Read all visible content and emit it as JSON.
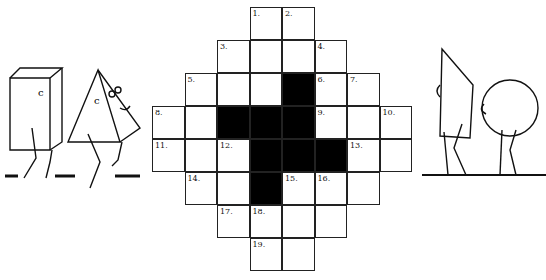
{
  "puzzle": {
    "type": "crossword",
    "cols": 8,
    "rows": 8,
    "cells": [
      {
        "r": 0,
        "c": 3,
        "n": "1."
      },
      {
        "r": 0,
        "c": 4,
        "n": "2."
      },
      {
        "r": 1,
        "c": 2,
        "n": "3."
      },
      {
        "r": 1,
        "c": 3
      },
      {
        "r": 1,
        "c": 4
      },
      {
        "r": 1,
        "c": 5,
        "n": "4."
      },
      {
        "r": 2,
        "c": 1,
        "n": "5."
      },
      {
        "r": 2,
        "c": 2
      },
      {
        "r": 2,
        "c": 3
      },
      {
        "r": 2,
        "c": 4,
        "black": true
      },
      {
        "r": 2,
        "c": 5,
        "n": "6."
      },
      {
        "r": 2,
        "c": 6,
        "n": "7."
      },
      {
        "r": 3,
        "c": 0,
        "n": "8."
      },
      {
        "r": 3,
        "c": 1
      },
      {
        "r": 3,
        "c": 2,
        "black": true
      },
      {
        "r": 3,
        "c": 3,
        "black": true
      },
      {
        "r": 3,
        "c": 4,
        "black": true
      },
      {
        "r": 3,
        "c": 5,
        "n": "9."
      },
      {
        "r": 3,
        "c": 6
      },
      {
        "r": 3,
        "c": 7,
        "n": "10."
      },
      {
        "r": 4,
        "c": 0,
        "n": "11."
      },
      {
        "r": 4,
        "c": 1
      },
      {
        "r": 4,
        "c": 2,
        "n": "12."
      },
      {
        "r": 4,
        "c": 3,
        "black": true
      },
      {
        "r": 4,
        "c": 4,
        "black": true
      },
      {
        "r": 4,
        "c": 5,
        "black": true
      },
      {
        "r": 4,
        "c": 6,
        "n": "13."
      },
      {
        "r": 4,
        "c": 7
      },
      {
        "r": 5,
        "c": 1,
        "n": "14."
      },
      {
        "r": 5,
        "c": 2
      },
      {
        "r": 5,
        "c": 3,
        "black": true
      },
      {
        "r": 5,
        "c": 4,
        "n": "15."
      },
      {
        "r": 5,
        "c": 5,
        "n": "16."
      },
      {
        "r": 5,
        "c": 6
      },
      {
        "r": 6,
        "c": 2,
        "n": "17."
      },
      {
        "r": 6,
        "c": 3,
        "n": "18."
      },
      {
        "r": 6,
        "c": 4
      },
      {
        "r": 6,
        "c": 5
      },
      {
        "r": 7,
        "c": 3,
        "n": "19."
      },
      {
        "r": 7,
        "c": 4
      }
    ]
  },
  "illustrations": {
    "left": [
      "cube-character",
      "pyramid-character"
    ],
    "right": [
      "prism-character",
      "sphere-character"
    ],
    "face_letter": "c"
  }
}
